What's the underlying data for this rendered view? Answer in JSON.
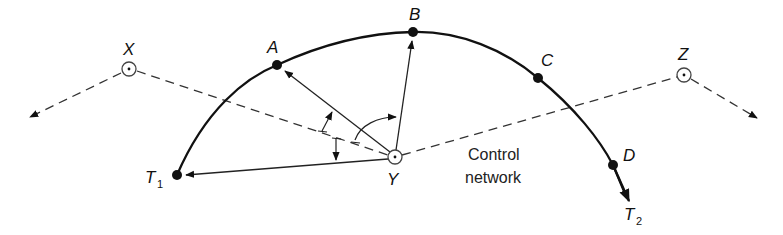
{
  "diagram": {
    "type": "survey-setting-out",
    "stations": [
      {
        "id": "X",
        "label": "X",
        "x": 129,
        "y": 69
      },
      {
        "id": "Y",
        "label": "Y",
        "x": 395,
        "y": 157
      },
      {
        "id": "Z",
        "label": "Z",
        "x": 684,
        "y": 75
      }
    ],
    "curve_points": [
      {
        "id": "T1",
        "label": "T",
        "sub": "1",
        "x": 177,
        "y": 175
      },
      {
        "id": "A",
        "label": "A",
        "x": 277,
        "y": 65
      },
      {
        "id": "B",
        "label": "B",
        "x": 413,
        "y": 32
      },
      {
        "id": "C",
        "label": "C",
        "x": 538,
        "y": 78
      },
      {
        "id": "D",
        "label": "D",
        "x": 613,
        "y": 165
      }
    ],
    "curve_end": {
      "id": "T2",
      "label": "T",
      "sub": "2",
      "x": 629,
      "y": 200
    },
    "network_label": {
      "line1": "Control",
      "line2": "network"
    },
    "colors": {
      "line": "#111111",
      "dash": "#333333",
      "point": "#111111"
    }
  }
}
